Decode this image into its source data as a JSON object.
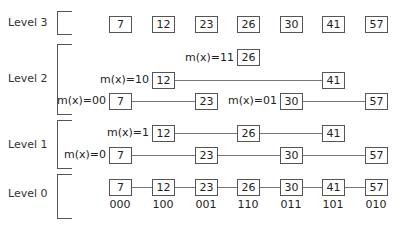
{
  "levels": [
    {
      "label": "Level 3"
    },
    {
      "label": "Level 2"
    },
    {
      "label": "Level 1"
    },
    {
      "label": "Level 0"
    }
  ],
  "level3": {
    "nodes": [
      "7",
      "12",
      "23",
      "26",
      "30",
      "41",
      "57"
    ]
  },
  "level2": {
    "lists": [
      {
        "mx": "m(x)=11",
        "nodes": [
          "26"
        ]
      },
      {
        "mx": "m(x)=10",
        "nodes": [
          "12",
          "41"
        ]
      },
      {
        "mx": "m(x)=00",
        "nodes": [
          "7",
          "23"
        ]
      },
      {
        "mx": "m(x)=01",
        "nodes": [
          "30",
          "57"
        ]
      }
    ]
  },
  "level1": {
    "lists": [
      {
        "mx": "m(x)=1",
        "nodes": [
          "12",
          "26",
          "41"
        ]
      },
      {
        "mx": "m(x)=0",
        "nodes": [
          "7",
          "23",
          "30",
          "57"
        ]
      }
    ]
  },
  "level0": {
    "nodes": [
      "7",
      "12",
      "23",
      "26",
      "30",
      "41",
      "57"
    ],
    "codes": [
      "000",
      "100",
      "001",
      "110",
      "011",
      "101",
      "010"
    ]
  }
}
